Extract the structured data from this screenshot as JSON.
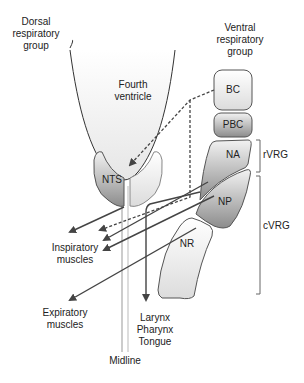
{
  "diagram": {
    "labels": {
      "dorsal": "Dorsal\nrespiratory\ngroup",
      "ventral": "Ventral\nrespiratory\ngroup",
      "fourth_ventricle": "Fourth\nventricle",
      "inspiratory": "Inspiratory\nmuscles",
      "expiratory": "Expiratory\nmuscles",
      "larynx": "Larynx\nPharynx\nTongue",
      "midline": "Midline",
      "rvrg": "rVRG",
      "cvrg": "cVRG"
    },
    "nuclei": {
      "bc": "BC",
      "pbc": "PBC",
      "na": "NA",
      "np": "NP",
      "nr": "NR",
      "nts": "NTS"
    },
    "colors": {
      "stroke": "#555555",
      "dark_fill": "#8a8a8a",
      "light_fill": "#ececec"
    }
  }
}
